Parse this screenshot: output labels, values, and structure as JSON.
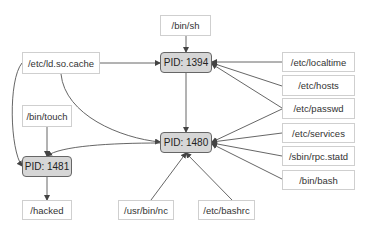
{
  "diagram": {
    "type": "process-file provenance graph",
    "colors": {
      "process_fill": "#d6d6d6",
      "process_border": "#666666",
      "file_fill": "#ffffff",
      "file_border": "#cfcfcf",
      "edge": "#555555"
    },
    "processes": [
      {
        "id": "p1394",
        "label": "PID: 1394"
      },
      {
        "id": "p1480",
        "label": "PID: 1480"
      },
      {
        "id": "p1481",
        "label": "PID: 1481"
      }
    ],
    "files": [
      {
        "id": "binsh",
        "label": "/bin/sh"
      },
      {
        "id": "ldcache",
        "label": "/etc/ld.so.cache"
      },
      {
        "id": "localtime",
        "label": "/etc/localtime"
      },
      {
        "id": "hosts",
        "label": "/etc/hosts"
      },
      {
        "id": "passwd",
        "label": "/etc/passwd"
      },
      {
        "id": "bintouch",
        "label": "/bin/touch"
      },
      {
        "id": "services",
        "label": "/etc/services"
      },
      {
        "id": "rpcstatd",
        "label": "/sbin/rpc.statd"
      },
      {
        "id": "binbash",
        "label": "/bin/bash"
      },
      {
        "id": "hacked",
        "label": "/hacked"
      },
      {
        "id": "usrbinnc",
        "label": "/usr/bin/nc"
      },
      {
        "id": "bashrc",
        "label": "/etc/bashrc"
      }
    ],
    "edges": [
      {
        "from": "/bin/sh",
        "to": "PID: 1394"
      },
      {
        "from": "/etc/ld.so.cache",
        "to": "PID: 1394"
      },
      {
        "from": "/etc/localtime",
        "to": "PID: 1394"
      },
      {
        "from": "/etc/hosts",
        "to": "PID: 1394"
      },
      {
        "from": "/etc/passwd",
        "to": "PID: 1394"
      },
      {
        "from": "PID: 1394",
        "to": "PID: 1480"
      },
      {
        "from": "/etc/ld.so.cache",
        "to": "PID: 1480"
      },
      {
        "from": "/etc/passwd",
        "to": "PID: 1480"
      },
      {
        "from": "/etc/services",
        "to": "PID: 1480"
      },
      {
        "from": "/sbin/rpc.statd",
        "to": "PID: 1480"
      },
      {
        "from": "/bin/bash",
        "to": "PID: 1480"
      },
      {
        "from": "/usr/bin/nc",
        "to": "PID: 1480"
      },
      {
        "from": "/etc/bashrc",
        "to": "PID: 1480"
      },
      {
        "from": "PID: 1480",
        "to": "PID: 1481"
      },
      {
        "from": "/etc/ld.so.cache",
        "to": "PID: 1481"
      },
      {
        "from": "/bin/touch",
        "to": "PID: 1481"
      },
      {
        "from": "PID: 1481",
        "to": "/hacked"
      }
    ]
  }
}
